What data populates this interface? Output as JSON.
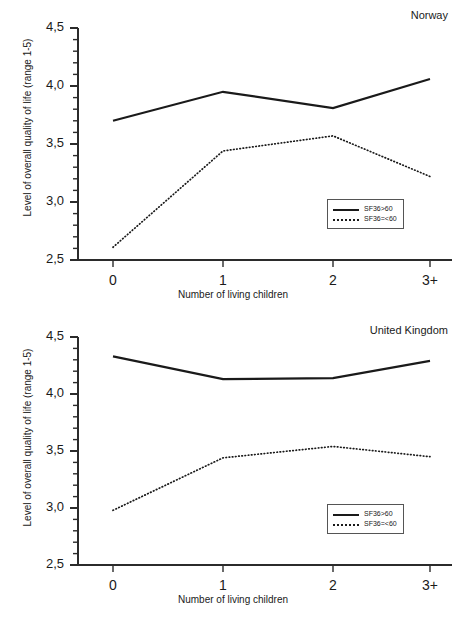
{
  "figure": {
    "panels": [
      {
        "id": "norway",
        "title": "Norway",
        "xlabel": "Number of living children",
        "ylabel": "Level of overall quality of life (range 1-5)",
        "ytick_labels": [
          "4,5",
          "4,0",
          "3,5",
          "3,0",
          "2,5"
        ],
        "xtick_labels": [
          "0",
          "1",
          "2",
          "3+"
        ],
        "legend": [
          {
            "label": "SF36>60",
            "style": "solid"
          },
          {
            "label": "SF36=<60",
            "style": "dotted"
          }
        ]
      },
      {
        "id": "uk",
        "title": "United Kingdom",
        "xlabel": "Number of living children",
        "ylabel": "Level of overall quality of life (range 1-5)",
        "ytick_labels": [
          "4,5",
          "4,0",
          "3,5",
          "3,0",
          "2,5"
        ],
        "xtick_labels": [
          "0",
          "1",
          "2",
          "3+"
        ],
        "legend": [
          {
            "label": "SF36>60",
            "style": "solid"
          },
          {
            "label": "SF36=<60",
            "style": "dotted"
          }
        ]
      }
    ]
  },
  "chart_data": [
    {
      "type": "line",
      "title": "Norway",
      "xlabel": "Number of living children",
      "ylabel": "Level of overall quality of life (range 1-5)",
      "categories": [
        "0",
        "1",
        "2",
        "3+"
      ],
      "ylim": [
        2.5,
        4.5
      ],
      "ytick_values": [
        2.5,
        3.0,
        3.5,
        4.0,
        4.5
      ],
      "ytick_labels": [
        "2,5",
        "3,0",
        "3,5",
        "4,0",
        "4,5"
      ],
      "yminor_step": 0.1,
      "grid": false,
      "legend_position": "lower right inside",
      "series": [
        {
          "name": "SF36>60",
          "style": "solid",
          "values": [
            3.7,
            3.95,
            3.81,
            4.06
          ]
        },
        {
          "name": "SF36=<60",
          "style": "dotted",
          "values": [
            2.61,
            3.44,
            3.57,
            3.22
          ]
        }
      ]
    },
    {
      "type": "line",
      "title": "United Kingdom",
      "xlabel": "Number of living children",
      "ylabel": "Level of overall quality of life (range 1-5)",
      "categories": [
        "0",
        "1",
        "2",
        "3+"
      ],
      "ylim": [
        2.5,
        4.5
      ],
      "ytick_values": [
        2.5,
        3.0,
        3.5,
        4.0,
        4.5
      ],
      "ytick_labels": [
        "2,5",
        "3,0",
        "3,5",
        "4,0",
        "4,5"
      ],
      "yminor_step": 0.1,
      "grid": false,
      "legend_position": "lower right inside",
      "series": [
        {
          "name": "SF36>60",
          "style": "solid",
          "values": [
            4.33,
            4.13,
            4.14,
            4.29
          ]
        },
        {
          "name": "SF36=<60",
          "style": "dotted",
          "values": [
            2.98,
            3.44,
            3.54,
            3.45
          ]
        }
      ]
    }
  ],
  "colors": {
    "line": "#1a1a1a",
    "axis": "#2b2b2b",
    "background": "#ffffff"
  }
}
